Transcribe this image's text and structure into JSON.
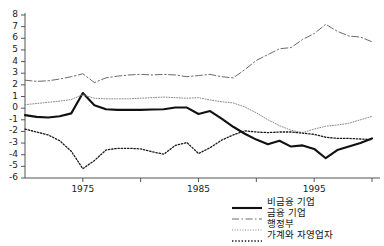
{
  "chart_data": {
    "type": "line",
    "title": "",
    "xlabel": "",
    "ylabel": "",
    "xlim": [
      1970,
      2000
    ],
    "ylim": [
      -6,
      8
    ],
    "grid": false,
    "legend_position": "bottom-right",
    "ytick_labels": [
      "8",
      "7",
      "6",
      "5",
      "4",
      "3",
      "2",
      "1",
      "0",
      "-1",
      "-2",
      "-3",
      "-4",
      "-5",
      "-6"
    ],
    "ytick_values": [
      8,
      7,
      6,
      5,
      4,
      3,
      2,
      1,
      0,
      -1,
      -2,
      -3,
      -4,
      -5,
      -6
    ],
    "xtick_values": [
      1975,
      1980,
      1985,
      1990,
      1995,
      2000
    ],
    "xtick_labels": [
      "1975",
      "",
      "1985",
      "",
      "1995",
      ""
    ],
    "x": [
      1970,
      1971,
      1972,
      1973,
      1974,
      1975,
      1976,
      1977,
      1978,
      1979,
      1980,
      1981,
      1982,
      1983,
      1984,
      1985,
      1986,
      1987,
      1988,
      1989,
      1990,
      1991,
      1992,
      1993,
      1994,
      1995,
      1996,
      1997,
      1998,
      1999,
      2000
    ],
    "series": [
      {
        "name": "비금융 기업",
        "style": "solid",
        "color": "#111111",
        "width": 2.1,
        "values": [
          -0.6,
          -0.75,
          -0.8,
          -0.7,
          -0.45,
          1.3,
          0.25,
          -0.1,
          -0.15,
          -0.15,
          -0.15,
          -0.12,
          -0.1,
          0.05,
          0.05,
          -0.5,
          -0.25,
          -0.9,
          -1.6,
          -2.2,
          -2.7,
          -3.1,
          -2.8,
          -3.3,
          -3.2,
          -3.5,
          -4.3,
          -3.6,
          -3.3,
          -3.0,
          -2.6
        ]
      },
      {
        "name": "금융 기업",
        "style": "dashdot",
        "color": "#6a6a6a",
        "width": 1.0,
        "values": [
          2.4,
          2.3,
          2.35,
          2.5,
          2.7,
          2.95,
          2.2,
          2.6,
          2.75,
          2.85,
          2.9,
          2.85,
          2.9,
          2.85,
          2.7,
          2.8,
          2.9,
          2.7,
          2.6,
          3.3,
          4.1,
          4.6,
          5.1,
          5.2,
          5.9,
          6.4,
          7.2,
          6.6,
          6.2,
          6.1,
          5.7
        ]
      },
      {
        "name": "행정부",
        "style": "dotted-fine",
        "color": "#8a8a8a",
        "width": 1.0,
        "values": [
          0.3,
          0.4,
          0.5,
          0.6,
          0.75,
          1.15,
          0.85,
          0.8,
          0.8,
          0.8,
          0.85,
          0.9,
          0.95,
          0.9,
          0.85,
          0.9,
          0.7,
          0.55,
          0.45,
          0.1,
          -0.4,
          -1.0,
          -1.5,
          -1.9,
          -2.1,
          -1.8,
          -1.55,
          -1.45,
          -1.3,
          -1.0,
          -0.7
        ]
      },
      {
        "name": "가계와 자영업자",
        "style": "dotted-coarse",
        "color": "#1a1a1a",
        "width": 1.3,
        "values": [
          -1.8,
          -2.05,
          -2.3,
          -2.8,
          -3.7,
          -5.2,
          -4.5,
          -3.6,
          -3.45,
          -3.45,
          -3.5,
          -3.75,
          -3.95,
          -3.2,
          -2.95,
          -3.9,
          -3.4,
          -2.75,
          -2.3,
          -1.95,
          -2.05,
          -2.1,
          -2.05,
          -2.05,
          -2.15,
          -2.25,
          -2.5,
          -2.6,
          -2.6,
          -2.65,
          -2.7
        ]
      }
    ]
  }
}
